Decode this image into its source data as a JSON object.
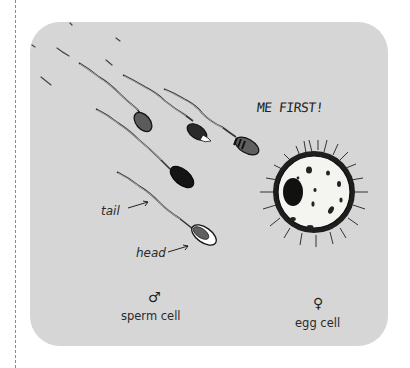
{
  "diagram": {
    "exclamation": "ME FIRST!",
    "labels": {
      "tail": "tail",
      "head": "head",
      "sperm_symbol": "♂",
      "sperm_caption": "sperm cell",
      "egg_symbol": "♀",
      "egg_caption": "egg cell"
    },
    "sperm_numbers": [
      "2",
      "4",
      "1"
    ],
    "colors": {
      "card_background": "#d6d6d6",
      "ink": "#1e1e1e",
      "egg_fill": "#f4f4f0"
    }
  }
}
